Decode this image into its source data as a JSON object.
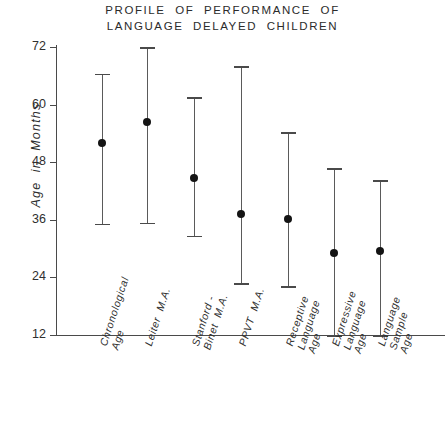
{
  "chart_data": {
    "type": "scatter",
    "title": "PROFILE OF PERFORMANCE OF\nLANGUAGE DELAYED CHILDREN",
    "title_lines": [
      "PROFILE  OF  PERFORMANCE  OF",
      "LANGUAGE  DELAYED  CHILDREN"
    ],
    "xlabel": "",
    "ylabel": "Age  in  Months",
    "ylim": [
      12,
      72
    ],
    "yticks": [
      12,
      24,
      36,
      48,
      60,
      72
    ],
    "ytick_labels": [
      "12",
      "24",
      "36",
      "48",
      "60",
      "72"
    ],
    "grid": false,
    "legend": null,
    "categories": [
      "Chronological\nAge",
      "Leiter  M.A.",
      "Stanford -\nBinet  M.A.",
      "PPVT  M.A.",
      "Receptive\nLanguage\nAge",
      "Expressive\nLanguage\nAge",
      "Language\nSample\nAge"
    ],
    "category_lines": [
      [
        "Chronological",
        "Age"
      ],
      [
        "Leiter  M.A."
      ],
      [
        "Stanford -",
        "Binet  M.A."
      ],
      [
        "PPVT  M.A."
      ],
      [
        "Receptive",
        "Language",
        "Age"
      ],
      [
        "Expressive",
        "Language",
        "Age"
      ],
      [
        "Language",
        "Sample",
        "Age"
      ]
    ],
    "series": [
      {
        "name": "Mean age with range",
        "values": [
          52.0,
          56.3,
          44.8,
          37.3,
          36.2,
          29.1,
          29.5
        ],
        "upper": [
          66.4,
          72.0,
          61.5,
          68.0,
          54.2,
          46.7,
          44.2
        ],
        "lower": [
          35.2,
          35.4,
          32.7,
          22.8,
          22.2,
          12.0,
          12.0
        ]
      }
    ],
    "marker_color": "#141414",
    "line_color": "#5a5a5a",
    "axis_color": "#4a4a4a",
    "background_color": "#ffffff"
  }
}
